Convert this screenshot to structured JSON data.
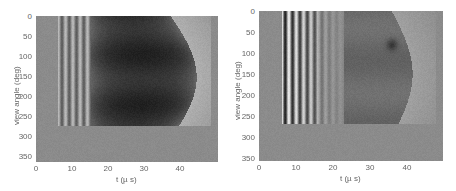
{
  "chart_data": [
    {
      "type": "heatmap",
      "title": "",
      "xlabel": "t (µ s)",
      "ylabel": "view angle (deg)",
      "xlim": [
        0,
        50
      ],
      "ylim": [
        0,
        360
      ],
      "y_reversed": true,
      "xticks": [
        0,
        10,
        20,
        30,
        40
      ],
      "yticks": [
        0,
        50,
        100,
        150,
        200,
        250,
        300,
        350
      ],
      "colormap": "gray",
      "grid": false,
      "description": "Sinogram: uniform gray background; data present for view angles 0-270 deg. Vertical light/dark stripes between t~6 and ~15 us, large dark region t~15-38 us with curved right boundary bulging to ~45 us near 150 deg, lighter gray from ~38-48 us. Angles 270-360 uniform gray.",
      "data_extent": {
        "t": [
          6,
          48
        ],
        "angle": [
          0,
          270
        ]
      },
      "stripe_t_positions": [
        6.5,
        7.5,
        8.5,
        9.5,
        10.5,
        11.5,
        12.5,
        13.5,
        14.5
      ]
    },
    {
      "type": "heatmap",
      "title": "",
      "xlabel": "t (µ s)",
      "ylabel": "view angle (deg)",
      "xlim": [
        0,
        50
      ],
      "ylim": [
        0,
        360
      ],
      "y_reversed": true,
      "xticks": [
        0,
        10,
        20,
        30,
        40
      ],
      "yticks": [
        0,
        50,
        100,
        150,
        200,
        250,
        300,
        350
      ],
      "colormap": "gray",
      "grid": false,
      "description": "Sinogram: uniform gray background; high-contrast vertical black/white stripes between t~6 and ~16 us fading to ~23 us for angles 0-270 deg; medium-dark diffuse region t~20-35 us with dark spot near t~36 us, angle~80 deg; lighter band curving near t~38-45 us. Angles 270-360 uniform gray.",
      "data_extent": {
        "t": [
          6,
          48
        ],
        "angle": [
          0,
          270
        ]
      },
      "stripe_t_positions": [
        6.5,
        7.5,
        8.0,
        9.0,
        10.0,
        11.0,
        12.0,
        13.0,
        14.0,
        15.0,
        16.0,
        18.0,
        20.0,
        22.0
      ]
    }
  ],
  "plots": [
    {
      "ylabel": "view angle (deg)",
      "xlabel": "t (µ s)",
      "xticks": [
        "0",
        "10",
        "20",
        "30",
        "40"
      ],
      "yticks": [
        "0",
        "50",
        "100",
        "150",
        "200",
        "250",
        "300",
        "350"
      ]
    },
    {
      "ylabel": "view angle (deg)",
      "xlabel": "t (µ s)",
      "xticks": [
        "0",
        "10",
        "20",
        "30",
        "40"
      ],
      "yticks": [
        "0",
        "50",
        "100",
        "150",
        "200",
        "250",
        "300",
        "350"
      ]
    }
  ],
  "colors": {
    "background_gray": "#8b8b8b",
    "dark": "#1a1a1a",
    "light": "#c8c8c8"
  }
}
